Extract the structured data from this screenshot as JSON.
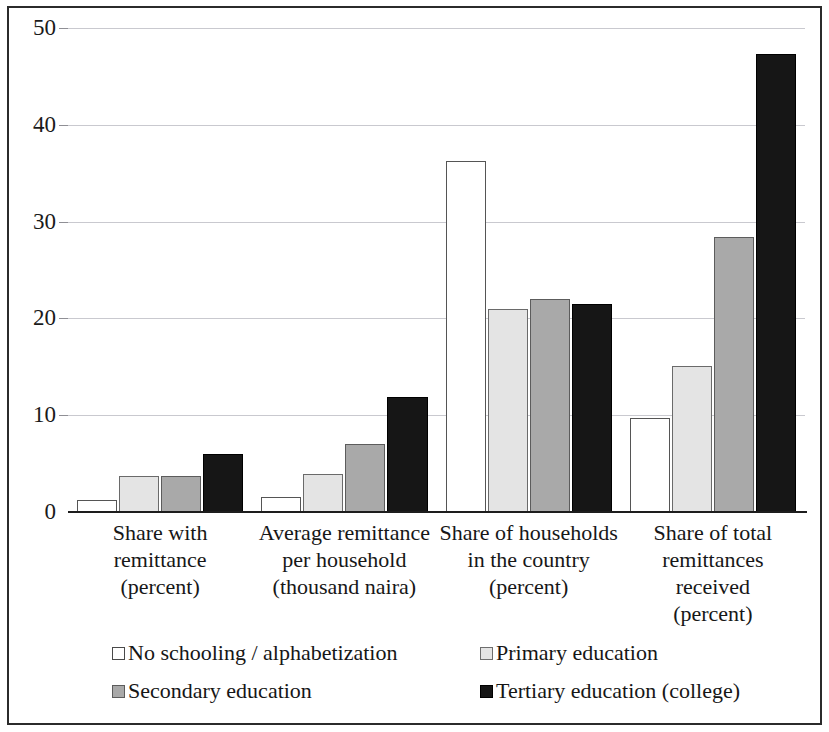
{
  "chart_data": {
    "type": "bar",
    "title": "",
    "subtitle": "",
    "xlabel": "",
    "ylabel": "",
    "ylim": [
      0,
      50
    ],
    "ytick_values": [
      0,
      10,
      20,
      30,
      40,
      50
    ],
    "ytick_labels": [
      "0",
      "10",
      "20",
      "30",
      "40",
      "50"
    ],
    "grid": true,
    "grid_axis": "y",
    "legend_position": "bottom",
    "categories": [
      "Share with remittance (percent)",
      "Average remittance per household (thousand naira)",
      "Share of households in the country (percent)",
      "Share of total remittances received (percent)"
    ],
    "category_label_lines": [
      [
        "Share with",
        "remittance",
        "(percent)"
      ],
      [
        "Average remittance",
        "per household",
        "(thousand naira)"
      ],
      [
        "Share of households",
        "in the country",
        "(percent)"
      ],
      [
        "Share of total",
        "remittances",
        "received",
        "(percent)"
      ]
    ],
    "series": [
      {
        "name": "No schooling / alphabetization",
        "color": "#ffffff",
        "values": [
          1.2,
          1.5,
          36.3,
          9.7
        ]
      },
      {
        "name": "Primary education",
        "color": "#e4e4e4",
        "values": [
          3.7,
          3.9,
          21.0,
          15.1
        ]
      },
      {
        "name": "Secondary education",
        "color": "#a9a9a9",
        "values": [
          3.7,
          7.0,
          22.0,
          28.4
        ]
      },
      {
        "name": "Tertiary education (college)",
        "color": "#161616",
        "values": [
          6.0,
          11.9,
          21.5,
          47.3
        ]
      }
    ]
  },
  "legend": {
    "items": [
      {
        "label": "No schooling / alphabetization",
        "swatch": "s0"
      },
      {
        "label": "Primary education",
        "swatch": "s1"
      },
      {
        "label": "Secondary education",
        "swatch": "s2"
      },
      {
        "label": "Tertiary education (college)",
        "swatch": "s3"
      }
    ]
  }
}
